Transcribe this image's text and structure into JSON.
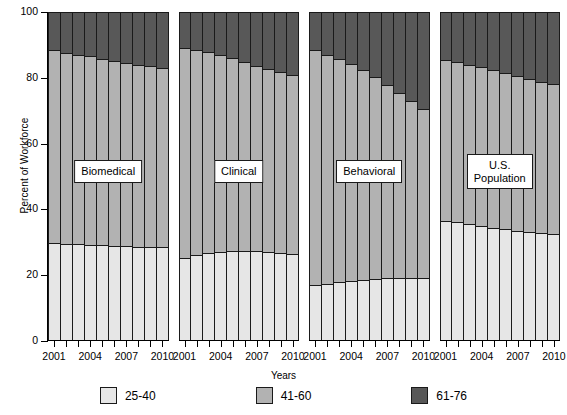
{
  "chart_data": {
    "type": "bar",
    "subtype": "stacked-percent",
    "title": "",
    "xlabel": "Years",
    "ylabel": "Percent of Workforce",
    "ylim": [
      0,
      100
    ],
    "yticks": [
      0,
      20,
      40,
      60,
      80,
      100
    ],
    "grid": false,
    "legend_position": "bottom",
    "x": [
      2001,
      2002,
      2003,
      2004,
      2005,
      2006,
      2007,
      2008,
      2009,
      2010
    ],
    "xtick_labels": [
      "2001",
      "2004",
      "2007",
      "2010"
    ],
    "xtick_indices": [
      0,
      3,
      6,
      9
    ],
    "series": [
      {
        "name": "25-40",
        "color": "#e6e6e6"
      },
      {
        "name": "41-60",
        "color": "#b2b2b2"
      },
      {
        "name": "61-76",
        "color": "#585858"
      }
    ],
    "panels": [
      {
        "label": "Biomedical",
        "values": {
          "25-40": [
            29.5,
            29.3,
            29.2,
            29.0,
            28.8,
            28.6,
            28.5,
            28.4,
            28.3,
            28.2
          ],
          "41-60": [
            58.5,
            58.0,
            57.5,
            57.2,
            56.7,
            56.2,
            55.7,
            55.3,
            55.0,
            54.6
          ],
          "61-76": [
            12.0,
            12.7,
            13.3,
            13.8,
            14.5,
            15.2,
            15.8,
            16.3,
            16.7,
            17.2
          ]
        }
      },
      {
        "label": "Clinical",
        "values": {
          "25-40": [
            25.0,
            25.9,
            26.4,
            26.8,
            27.1,
            27.2,
            27.0,
            26.7,
            26.4,
            26.1
          ],
          "41-60": [
            63.8,
            62.3,
            61.1,
            59.9,
            58.7,
            57.4,
            56.4,
            55.6,
            55.0,
            54.6
          ],
          "61-76": [
            11.2,
            11.8,
            12.5,
            13.3,
            14.2,
            15.4,
            16.6,
            17.7,
            18.6,
            19.3
          ]
        }
      },
      {
        "label": "Behavioral",
        "values": {
          "25-40": [
            16.8,
            17.1,
            17.5,
            17.9,
            18.2,
            18.5,
            18.7,
            18.8,
            18.9,
            19.0
          ],
          "41-60": [
            71.2,
            69.6,
            67.9,
            65.9,
            63.8,
            61.4,
            58.8,
            56.2,
            53.6,
            51.2
          ],
          "61-76": [
            12.0,
            13.3,
            14.6,
            16.2,
            18.0,
            20.1,
            22.5,
            25.0,
            27.5,
            29.8
          ]
        }
      },
      {
        "label": "U.S.\nPopulation",
        "values": {
          "25-40": [
            36.2,
            35.8,
            35.3,
            34.7,
            34.1,
            33.6,
            33.1,
            32.7,
            32.4,
            32.1
          ],
          "41-60": [
            48.8,
            48.6,
            48.4,
            48.2,
            47.9,
            47.5,
            47.0,
            46.5,
            46.0,
            45.6
          ],
          "61-76": [
            15.0,
            15.6,
            16.3,
            17.1,
            18.0,
            18.9,
            19.9,
            20.8,
            21.6,
            22.3
          ]
        }
      }
    ]
  },
  "axes": {
    "ylabel": "Percent of Workforce",
    "xlabel": "Years",
    "ytick_labels": [
      "0",
      "20",
      "40",
      "60",
      "80",
      "100"
    ]
  },
  "legend": {
    "items": [
      {
        "label": "25-40",
        "color": "#e6e6e6"
      },
      {
        "label": "41-60",
        "color": "#b2b2b2"
      },
      {
        "label": "61-76",
        "color": "#585858"
      }
    ]
  }
}
